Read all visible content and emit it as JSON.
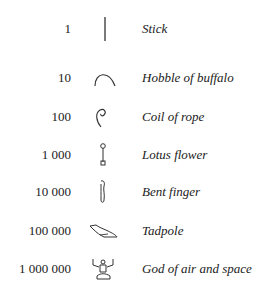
{
  "table": {
    "rows": [
      {
        "value": "1",
        "icon": "stick-glyph-icon",
        "name": "Stick"
      },
      {
        "value": "10",
        "icon": "hobble-glyph-icon",
        "name": "Hobble of buffalo"
      },
      {
        "value": "100",
        "icon": "coil-of-rope-glyph-icon",
        "name": "Coil of rope"
      },
      {
        "value": "1 000",
        "icon": "lotus-flower-glyph-icon",
        "name": "Lotus flower"
      },
      {
        "value": "10 000",
        "icon": "bent-finger-glyph-icon",
        "name": "Bent finger"
      },
      {
        "value": "100 000",
        "icon": "tadpole-glyph-icon",
        "name": "Tadpole"
      },
      {
        "value": "1 000 000",
        "icon": "god-of-air-glyph-icon",
        "name": "God of air and space"
      }
    ]
  }
}
